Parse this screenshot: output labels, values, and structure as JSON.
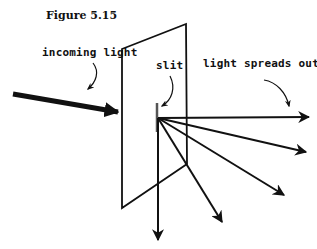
{
  "figure": {
    "title": "Figure 5.15"
  },
  "labels": {
    "incoming": "incoming light",
    "slit": "slit",
    "spreads": "light spreads out"
  },
  "colors": {
    "ink": "#111111",
    "slit": "#555555",
    "background": "#ffffff"
  }
}
